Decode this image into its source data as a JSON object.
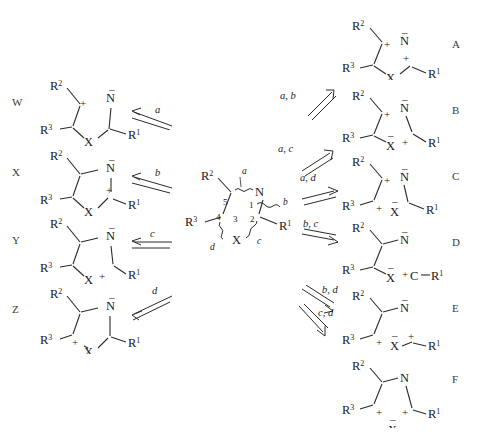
{
  "figure": {
    "type": "chemical-fragmentation-scheme",
    "substituents": [
      "R1",
      "R2",
      "R3"
    ],
    "heteroatoms": [
      "N",
      "X"
    ],
    "ring_positions": [
      "1",
      "2",
      "3",
      "4",
      "5"
    ]
  },
  "center": {
    "label_R1": "R",
    "label_R1_sup": "1",
    "label_R2": "R",
    "label_R2_sup": "2",
    "label_R3": "R",
    "label_R3_sup": "3",
    "atom_N": "N",
    "atom_X": "X",
    "ring_numbers": [
      "1",
      "2",
      "3",
      "4",
      "5"
    ],
    "bond_labels": [
      "a",
      "b",
      "c",
      "d"
    ]
  },
  "left_column": {
    "title": "cyclic ylides",
    "rows": [
      {
        "id": "W",
        "label": "W",
        "arrow_label": "a",
        "bond_cleaved": "a",
        "charges": [
          {
            "site": "C5",
            "sign": "+"
          },
          {
            "site": "N1",
            "sign": "−"
          }
        ]
      },
      {
        "id": "X",
        "label": "X",
        "arrow_label": "b",
        "bond_cleaved": "b",
        "charges": [
          {
            "site": "C2",
            "sign": "+"
          },
          {
            "site": "N1",
            "sign": "−"
          }
        ]
      },
      {
        "id": "Y",
        "label": "Y",
        "arrow_label": "c",
        "bond_cleaved": "c",
        "charges": [
          {
            "site": "X3",
            "sign": "+"
          },
          {
            "site": "N1",
            "sign": "−"
          }
        ]
      },
      {
        "id": "Z",
        "label": "Z",
        "arrow_label": "d",
        "bond_cleaved": "d",
        "charges": [
          {
            "site": "C4",
            "sign": "+"
          },
          {
            "site": "N1",
            "sign": "−"
          }
        ]
      }
    ]
  },
  "right_column": {
    "title": "acyclic fragmentation products",
    "rows": [
      {
        "id": "A",
        "label": "A",
        "arrow_label": "a, b",
        "bonds_cleaved": [
          "a",
          "b"
        ],
        "charges": [
          {
            "site": "C5",
            "sign": "+"
          },
          {
            "site": "N1",
            "sign": "−"
          },
          {
            "site": "C2",
            "sign": "+"
          }
        ],
        "split": false
      },
      {
        "id": "B",
        "label": "B",
        "arrow_label": "a, c",
        "bonds_cleaved": [
          "a",
          "c"
        ],
        "charges": [
          {
            "site": "C5",
            "sign": "+"
          },
          {
            "site": "N1",
            "sign": "−"
          },
          {
            "site": "X3",
            "sign": "−"
          },
          {
            "site": "C2",
            "sign": "+"
          }
        ],
        "split": false
      },
      {
        "id": "C",
        "label": "C",
        "arrow_label": "a, d",
        "bonds_cleaved": [
          "a",
          "d"
        ],
        "charges": [
          {
            "site": "C5",
            "sign": "+"
          },
          {
            "site": "N1",
            "sign": "−"
          },
          {
            "site": "C4",
            "sign": "+"
          },
          {
            "site": "X3",
            "sign": "−"
          }
        ],
        "split": false
      },
      {
        "id": "D",
        "label": "D",
        "arrow_label": "b, c",
        "bonds_cleaved": [
          "b",
          "c"
        ],
        "charges": [
          {
            "site": "N1",
            "sign": "−"
          },
          {
            "site": "X3",
            "sign": "−"
          },
          {
            "site": "C2",
            "sign": "+"
          }
        ],
        "split": true,
        "fragment": "C−R1"
      },
      {
        "id": "E",
        "label": "E",
        "arrow_label": "b, d",
        "bonds_cleaved": [
          "b",
          "d"
        ],
        "charges": [
          {
            "site": "N1",
            "sign": "−"
          },
          {
            "site": "C4",
            "sign": "+"
          },
          {
            "site": "X3",
            "sign": "−"
          },
          {
            "site": "C2",
            "sign": "+"
          }
        ],
        "split": false
      },
      {
        "id": "F",
        "label": "F",
        "arrow_label": "c, d",
        "bonds_cleaved": [
          "c",
          "d"
        ],
        "charges": [
          {
            "site": "C4",
            "sign": "+"
          },
          {
            "site": "C2",
            "sign": "+"
          },
          {
            "site": "X3",
            "sign": "−"
          }
        ],
        "split": true,
        "fragment": "X"
      }
    ]
  },
  "atoms": {
    "N": "N",
    "X": "X",
    "C": "C",
    "R1": "R",
    "R2": "R",
    "R3": "R",
    "sup1": "1",
    "sup2": "2",
    "sup3": "3"
  },
  "charge_glyphs": {
    "plus": "+",
    "minus": "−"
  }
}
